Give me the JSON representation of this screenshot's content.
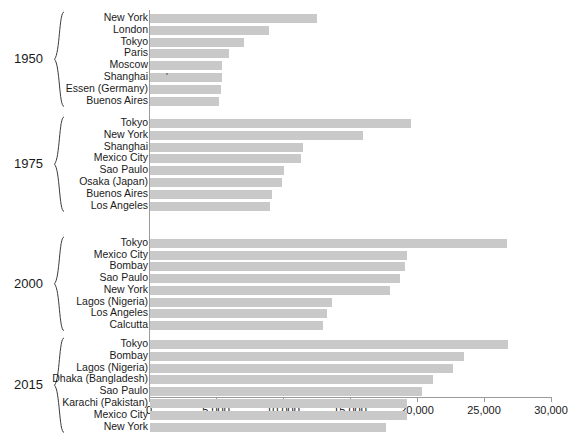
{
  "chart_data": {
    "type": "bar",
    "orientation": "horizontal",
    "title": "",
    "subtitle": "",
    "xlabel": "",
    "ylabel": "",
    "xlim": [
      0,
      30000
    ],
    "xticks": [
      0,
      5000,
      10000,
      15000,
      20000,
      25000,
      30000
    ],
    "xtick_labels": [
      "0",
      "5,000",
      "10,000",
      "15,000",
      "20,000",
      "25,000",
      "30,000"
    ],
    "grid": false,
    "legend": "none",
    "bar_color": "#c9c9c9",
    "axis_color": "#9a9a9a",
    "text_color": "#1a1a1a",
    "value_unit": "thousands of people",
    "groups": [
      {
        "year": "1950",
        "categories": [
          "New York",
          "London",
          "Tokyo",
          "Paris",
          "Moscow",
          "Shanghai",
          "Essen (Germany)",
          "Buenos Aires"
        ],
        "values": [
          12463,
          8860,
          7000,
          5900,
          5400,
          5400,
          5300,
          5150
        ]
      },
      {
        "year": "1975",
        "categories": [
          "Tokyo",
          "New York",
          "Shanghai",
          "Mexico City",
          "Sao Paulo",
          "Osaka (Japan)",
          "Buenos Aires",
          "Los Angeles"
        ],
        "values": [
          19478,
          15880,
          11400,
          11240,
          10000,
          9840,
          9140,
          8930
        ]
      },
      {
        "year": "2000",
        "categories": [
          "Tokyo",
          "Mexico City",
          "Bombay",
          "Sao Paulo",
          "New York",
          "Lagos (Nigeria)",
          "Los Angeles",
          "Calcutta"
        ],
        "values": [
          26640,
          19180,
          19030,
          18670,
          17900,
          13600,
          13200,
          12920
        ]
      },
      {
        "year": "2015",
        "categories": [
          "Tokyo",
          "Bombay",
          "Lagos (Nigeria)",
          "Dhaka (Bangladesh)",
          "Sao Paulo",
          "Karachi (Pakistan)",
          "Mexico City",
          "New York"
        ],
        "values": [
          26700,
          23430,
          22600,
          21100,
          20300,
          19200,
          19180,
          17600
        ]
      }
    ]
  }
}
